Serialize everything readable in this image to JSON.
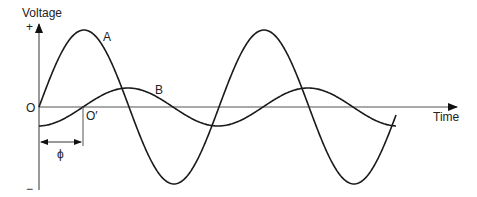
{
  "diagram": {
    "y_axis_label": "Voltage",
    "x_axis_label": "Time",
    "plus_sign": "+",
    "minus_sign": "−",
    "origin_label": "O",
    "shifted_origin_label": "O′",
    "phase_label": "ϕ",
    "curves": [
      {
        "name": "A",
        "label": "A",
        "amplitude": "large",
        "period_px": 180,
        "starts_at": "O"
      },
      {
        "name": "B",
        "label": "B",
        "amplitude": "small",
        "period_px": 180,
        "starts_at": "O′"
      }
    ],
    "colors": {
      "curve": "#1a1a1a",
      "axis": "#555555",
      "text": "#222222",
      "background": "#ffffff"
    }
  }
}
